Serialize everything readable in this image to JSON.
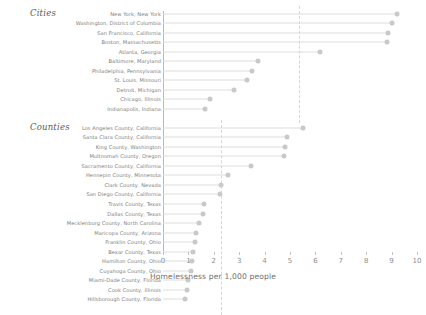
{
  "chart_data": {
    "type": "bar",
    "title": "",
    "xlabel": "Homelessness per 1,000 people",
    "ylabel": "",
    "xlim": [
      0,
      10.3
    ],
    "xticks": [
      0,
      1,
      2,
      3,
      4,
      5,
      6,
      7,
      8,
      9,
      10
    ],
    "xtick_labels": [
      "0",
      "1",
      "2",
      "3",
      "4",
      "5",
      "6",
      "7",
      "8",
      "9",
      "10"
    ],
    "grid": false,
    "legend": "none",
    "orientation": "horizontal",
    "marker": "circle",
    "groups": [
      {
        "name": "Cities",
        "label": "Cities",
        "reference_line": 5.35,
        "categories": [
          "New York, New York",
          "Washington, District of Columbia",
          "San Francisco, California",
          "Boston, Massachusetts",
          "Atlanta, Georgia",
          "Baltimore, Maryland",
          "Philadelphia, Pennsylvania",
          "St. Louis, Missouri",
          "Detroit, Michigan",
          "Chicago, Illinois",
          "Indianapolis, Indiana"
        ],
        "values": [
          9.2,
          9.0,
          8.85,
          8.8,
          6.2,
          3.75,
          3.5,
          3.3,
          2.8,
          1.85,
          1.65
        ]
      },
      {
        "name": "Counties",
        "label": "Counties",
        "reference_line": 2.3,
        "categories": [
          "Los Angeles County, California",
          "Santa Clara County, California",
          "King County, Washington",
          "Multnomah County, Oregon",
          "Sacramento County, California",
          "Hennepin County, Minnesota",
          "Clark County, Nevada",
          "San Diego County, California",
          "Travis County, Texas",
          "Dallas County, Texas",
          "Mecklenburg County, North Carolina",
          "Maricopa County, Arizona",
          "Franklin County, Ohio",
          "Bexar County, Texas",
          "Hamilton County, Ohio",
          "Cuyahoga County, Ohio",
          "Miami-Dade County, Florida",
          "Cook County, Illinois",
          "Hillsborough County, Florida"
        ],
        "values": [
          5.5,
          4.9,
          4.8,
          4.75,
          3.45,
          2.55,
          2.3,
          2.25,
          1.6,
          1.57,
          1.4,
          1.3,
          1.25,
          1.2,
          1.15,
          1.1,
          1.0,
          0.95,
          0.85
        ]
      }
    ],
    "colors": {
      "marker": "#c9c9c9",
      "stem": "#dddddd",
      "axis": "#b9b9b9",
      "reference_line": "#d6d6d6",
      "label_text": "#7d7d7d",
      "heading_text": "#5a5a5a",
      "background": "#ffffff"
    }
  }
}
